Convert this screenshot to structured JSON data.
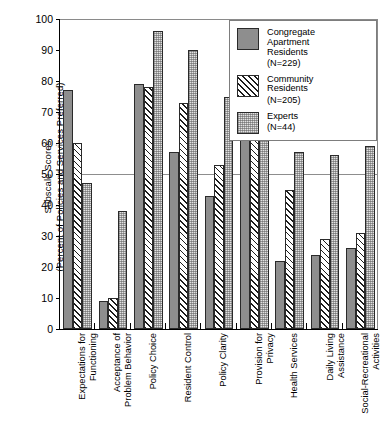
{
  "chart_data": {
    "type": "bar",
    "title": "",
    "xlabel": "",
    "ylabel": "Subscale Scores (Percent of Policies and Services Preferred)",
    "ylabel_lines": [
      "Subscale Scores",
      "(Percent of Policies and Services Preferred)"
    ],
    "ylim": [
      0,
      100
    ],
    "ytick_step": 10,
    "yticks": [
      0,
      10,
      20,
      30,
      40,
      50,
      60,
      70,
      80,
      90,
      100
    ],
    "grid": false,
    "reference_line": 50,
    "legend_position": "top-right",
    "categories": [
      "Expectations for Functioning",
      "Acceptance of Problem Behavior",
      "Policy Choice",
      "Resident Control",
      "Policy Clarity",
      "Provision for Privacy",
      "Health Services",
      "Daily Living Assistance",
      "Social-Recreational Activities"
    ],
    "category_lines": [
      [
        "Expectations for",
        "Functioning"
      ],
      [
        "Acceptance of",
        "Problem Behavior"
      ],
      [
        "Policy Choice"
      ],
      [
        "Resident Control"
      ],
      [
        "Policy Clarity"
      ],
      [
        "Provision for",
        "Privacy"
      ],
      [
        "Health Services"
      ],
      [
        "Daily Living",
        "Assistance"
      ],
      [
        "Social-Recreational",
        "Activities"
      ]
    ],
    "series": [
      {
        "name": "Congregate Apartment Residents (N=229)",
        "name_lines": [
          "Congregate",
          "Apartment",
          "Residents"
        ],
        "n_label": "(N=229)",
        "pattern": "solid-gray",
        "color": "#8e8e8e",
        "values": [
          77,
          9,
          79,
          57,
          43,
          79,
          22,
          24,
          26
        ]
      },
      {
        "name": "Community Residents (N=205)",
        "name_lines": [
          "Community",
          "Residents"
        ],
        "n_label": "(N=205)",
        "pattern": "diagonal-hatch",
        "color": "#1c1c1c",
        "values": [
          60,
          10,
          78,
          73,
          53,
          69,
          45,
          29,
          31
        ]
      },
      {
        "name": "Experts (N=44)",
        "name_lines": [
          "Experts"
        ],
        "n_label": "(N=44)",
        "pattern": "dotted-light",
        "color": "#e2e2e2",
        "values": [
          47,
          38,
          96,
          90,
          75,
          89,
          57,
          56,
          59
        ]
      }
    ]
  }
}
